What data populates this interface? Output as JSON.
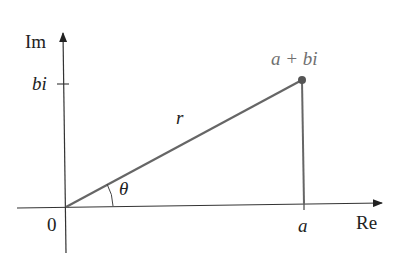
{
  "diagram": {
    "type": "complex-plane",
    "axes": {
      "x_label": "Re",
      "y_label": "Im",
      "origin_label": "0"
    },
    "point": {
      "label": "a + bi",
      "x_label": "a",
      "y_label": "bi"
    },
    "vector_label": "r",
    "angle_label": "θ",
    "colors": {
      "axes": "#333333",
      "vector": "#666666",
      "point": "#555555",
      "point_label": "#707070"
    }
  }
}
